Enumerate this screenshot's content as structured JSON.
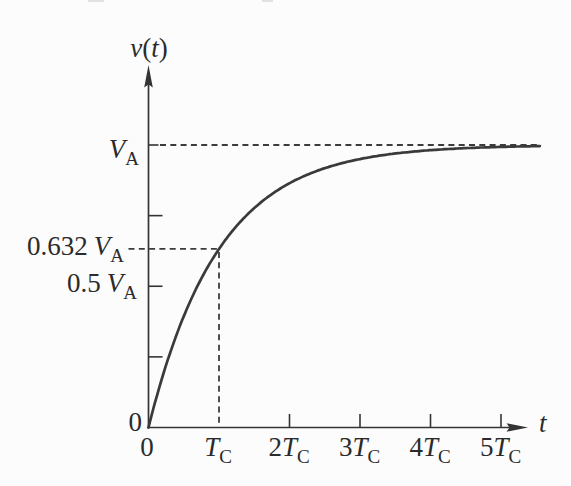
{
  "figure": {
    "background": "#fcfcfc",
    "ink_color": "#3a3a3a",
    "text_color": "#2b2b2b"
  },
  "chart_data": {
    "type": "line",
    "title": "",
    "ylabel": "v(t)",
    "xlabel": "t",
    "grid": false,
    "legend": false,
    "axis_ranges": {
      "x_in_tc_units": [
        0,
        5.3
      ],
      "y_in_va_units": [
        0,
        1.27
      ]
    },
    "y_axis": {
      "title_parts": [
        "v",
        "(",
        "t",
        ")"
      ],
      "labels": [
        {
          "pre": "",
          "var": "V",
          "sub": "A",
          "value_va": 1.0
        },
        {
          "pre": "0.632",
          "var": "V",
          "sub": "A",
          "value_va": 0.632
        },
        {
          "pre": "0.5",
          "var": "V",
          "sub": "A",
          "value_va": 0.5
        },
        {
          "pre": "0",
          "var": "",
          "sub": "",
          "value_va": 0
        }
      ],
      "minor_ticks_va": [
        0.75,
        0.5,
        0.25
      ]
    },
    "x_axis": {
      "title": "t",
      "labels": [
        {
          "pre": "0",
          "var": "",
          "sub": ""
        },
        {
          "pre": "",
          "var": "T",
          "sub": "C"
        },
        {
          "pre": "2",
          "var": "T",
          "sub": "C"
        },
        {
          "pre": "3",
          "var": "T",
          "sub": "C"
        },
        {
          "pre": "4",
          "var": "T",
          "sub": "C"
        },
        {
          "pre": "5",
          "var": "T",
          "sub": "C"
        }
      ],
      "tick_values_tc": [
        0,
        1,
        2,
        3,
        4,
        5
      ],
      "tick_marks_tc": [
        2,
        3,
        4,
        5
      ]
    },
    "curve": {
      "equation": "v(t) = VA (1 - e^(-t/TC))",
      "x_end_tc": 5.57,
      "points_tc_va": [
        [
          0,
          0
        ],
        [
          1,
          0.632
        ],
        [
          2,
          0.865
        ],
        [
          3,
          0.95
        ],
        [
          4,
          0.982
        ],
        [
          5,
          0.993
        ]
      ]
    },
    "annotations": {
      "asymptote_va": 1.0,
      "marker_point": {
        "t_tc": 1.0,
        "v_va": 0.632
      }
    }
  }
}
